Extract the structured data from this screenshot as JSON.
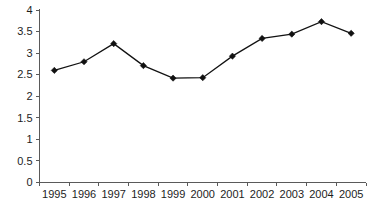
{
  "chart_data": {
    "type": "line",
    "title": "",
    "subtitle": "",
    "xlabel": "",
    "ylabel": "",
    "categories": [
      "1995",
      "1996",
      "1997",
      "1998",
      "1999",
      "2000",
      "2001",
      "2002",
      "2003",
      "2004",
      "2005"
    ],
    "values": [
      2.6,
      2.8,
      3.22,
      2.71,
      2.42,
      2.43,
      2.93,
      3.34,
      3.44,
      3.73,
      3.46
    ],
    "series": [
      {
        "name": "series-1",
        "values": [
          2.6,
          2.8,
          3.22,
          2.71,
          2.42,
          2.43,
          2.93,
          3.34,
          3.44,
          3.73,
          3.46
        ],
        "color": "#111111",
        "marker": "diamond"
      }
    ],
    "ylim": [
      0,
      4
    ],
    "xlim": [
      0,
      10
    ],
    "ytick_labels": [
      "0",
      "0.5",
      "1",
      "1.5",
      "2",
      "2.5",
      "3",
      "3.5",
      "4"
    ],
    "ytick_values": [
      0,
      0.5,
      1,
      1.5,
      2,
      2.5,
      3,
      3.5,
      4
    ],
    "xtick_labels": [
      "1995",
      "1996",
      "1997",
      "1998",
      "1999",
      "2000",
      "2001",
      "2002",
      "2003",
      "2004",
      "2005"
    ],
    "grid": false,
    "legend": false,
    "legend_position": "none",
    "annotations": []
  },
  "colors": {
    "background": "#ffffff",
    "axis": "#5a5a5a",
    "series": "#111111",
    "text": "#1d1d1d"
  }
}
